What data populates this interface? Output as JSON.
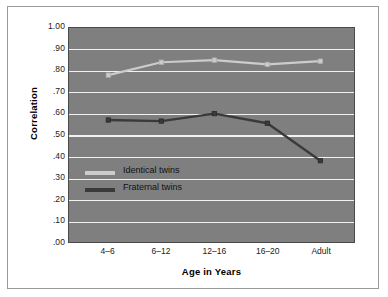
{
  "chart_data": {
    "type": "line",
    "title": "",
    "xlabel": "Age in Years",
    "ylabel": "Correlation",
    "categories": [
      "4–6",
      "6–12",
      "12–16",
      "16–20",
      "Adult"
    ],
    "ylim": [
      0.0,
      1.0
    ],
    "ytick_labels": [
      "1.00",
      ".90",
      ".80",
      ".70",
      ".60",
      ".50",
      ".40",
      ".30",
      ".20",
      ".10",
      ".00"
    ],
    "ytick_values": [
      1.0,
      0.9,
      0.8,
      0.7,
      0.6,
      0.5,
      0.4,
      0.3,
      0.2,
      0.1,
      0.0
    ],
    "grid": true,
    "legend_position": "inside-lower-left",
    "series": [
      {
        "name": "Identical twins",
        "color": "#cccccc",
        "values": [
          0.78,
          0.84,
          0.85,
          0.83,
          0.845
        ]
      },
      {
        "name": "Fraternal twins",
        "color": "#3a3a3a",
        "values": [
          0.57,
          0.565,
          0.6,
          0.555,
          0.38
        ]
      }
    ],
    "plot_background": "#7f7f7f",
    "gridline_color": "#f2f2f2",
    "page_background": "#ffffff",
    "border_color": "#9a9a9a"
  }
}
